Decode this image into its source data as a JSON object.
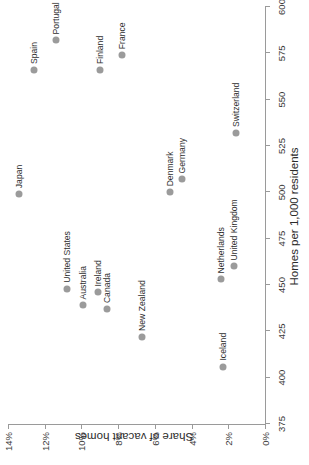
{
  "chart_data": {
    "type": "scatter",
    "title": "",
    "xlabel": "Homes per 1,000 residents",
    "ylabel": "Share of vacant homes",
    "xlim": [
      375,
      600
    ],
    "ylim": [
      0,
      14
    ],
    "grid": false,
    "legend": "none",
    "xticks": [
      375,
      400,
      425,
      450,
      475,
      500,
      525,
      550,
      575,
      600
    ],
    "xtick_labels": [
      "375",
      "400",
      "425",
      "450",
      "475",
      "500",
      "525",
      "550",
      "575",
      "600"
    ],
    "yticks": [
      0,
      2,
      4,
      6,
      8,
      10,
      12,
      14
    ],
    "ytick_labels": [
      "0%",
      "2%",
      "4%",
      "6%",
      "8%",
      "10%",
      "12%",
      "14%"
    ],
    "point_color": "#9b9b9b",
    "points": [
      {
        "label": "Japan",
        "x": 499,
        "y": 13.4
      },
      {
        "label": "Spain",
        "x": 566,
        "y": 12.6
      },
      {
        "label": "Portugal",
        "x": 582,
        "y": 11.4
      },
      {
        "label": "United States",
        "x": 448,
        "y": 10.8
      },
      {
        "label": "Australia",
        "x": 439,
        "y": 9.9
      },
      {
        "label": "Ireland",
        "x": 446,
        "y": 9.1
      },
      {
        "label": "Finland",
        "x": 566,
        "y": 9.0
      },
      {
        "label": "Canada",
        "x": 437,
        "y": 8.6
      },
      {
        "label": "France",
        "x": 574,
        "y": 7.8
      },
      {
        "label": "New Zealand",
        "x": 422,
        "y": 6.7
      },
      {
        "label": "Denmark",
        "x": 500,
        "y": 5.2
      },
      {
        "label": "Germany",
        "x": 507,
        "y": 4.5
      },
      {
        "label": "Netherlands",
        "x": 453,
        "y": 2.4
      },
      {
        "label": "Iceland",
        "x": 406,
        "y": 2.3
      },
      {
        "label": "United Kingdom",
        "x": 460,
        "y": 1.7
      },
      {
        "label": "Switzerland",
        "x": 532,
        "y": 1.6
      }
    ]
  }
}
